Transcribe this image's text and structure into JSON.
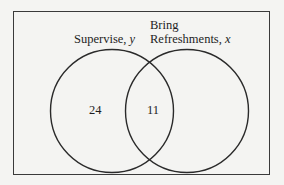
{
  "diagram": {
    "type": "venn",
    "sets": [
      {
        "id": "supervise",
        "label": "Supervise,",
        "variable": "y",
        "only_count": "24"
      },
      {
        "id": "refreshments",
        "label_line1": "Bring",
        "label_line2": "Refreshments,",
        "variable": "x"
      }
    ],
    "intersection_count": "11",
    "colors": {
      "stroke": "#2a2a2a",
      "background": "#f4f4f2",
      "text": "#1e1e1e"
    }
  }
}
